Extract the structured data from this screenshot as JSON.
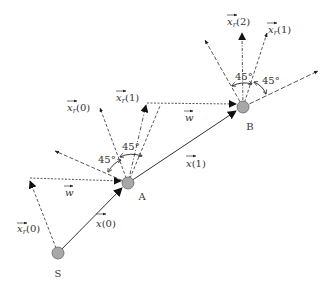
{
  "diagram": {
    "nodes": {
      "S": {
        "label": "S",
        "x": 58,
        "y": 253
      },
      "A": {
        "label": "A",
        "x": 128,
        "y": 183
      },
      "B": {
        "label": "B",
        "x": 243,
        "y": 107
      }
    },
    "labels": {
      "xr0_left": {
        "base": "x",
        "sub": "r",
        "arg": "(0)"
      },
      "x0": {
        "base": "x",
        "arg": "(0)"
      },
      "w_lower": {
        "base": "w"
      },
      "xr0_top": {
        "base": "x",
        "sub": "r",
        "arg": "(0)"
      },
      "xr1_A": {
        "base": "x",
        "sub": "r",
        "arg": "(1)"
      },
      "w_upper": {
        "base": "w"
      },
      "x1": {
        "base": "x",
        "arg": "(1)"
      },
      "xr2_B": {
        "base": "x",
        "sub": "r",
        "arg": "(2)"
      },
      "xr1_B": {
        "base": "x",
        "sub": "r",
        "arg": "(1)"
      },
      "angle_A_left": "45°",
      "angle_A_top": "45°",
      "angle_B_left": "45°",
      "angle_B_right": "45°"
    },
    "colors": {
      "node_fill": "#a8a8a8",
      "node_stroke": "#555555",
      "line": "#333333"
    }
  }
}
